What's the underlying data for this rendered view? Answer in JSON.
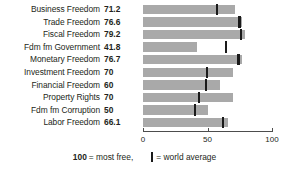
{
  "chart_data": {
    "type": "bar",
    "orientation": "horizontal",
    "title": "",
    "xlabel": "",
    "ylabel": "",
    "xlim": [
      0,
      100
    ],
    "xticks": [
      0,
      50,
      100
    ],
    "xticklabels": [
      "0",
      "50",
      "100"
    ],
    "grid": false,
    "categories": [
      "Business Freedom",
      "Trade Freedom",
      "Fiscal Freedom",
      "Fdm fm Government",
      "Monetary Freedom",
      "Investment Freedom",
      "Financial Freedom",
      "Property Rights",
      "Fdm fm Corruption",
      "Labor Freedom"
    ],
    "values": [
      71.2,
      76.6,
      79.2,
      41.8,
      76.7,
      70,
      60,
      70,
      50,
      66.1
    ],
    "value_labels": [
      "71.2",
      "76.6",
      "79.2",
      "41.8",
      "76.7",
      "70",
      "60",
      "70",
      "50",
      "66.1"
    ],
    "world_average": [
      57.5,
      74.8,
      76.0,
      64.5,
      74.0,
      49.5,
      49.0,
      43.5,
      40.5,
      62.0
    ],
    "series": [
      {
        "name": "Country score",
        "values": [
          71.2,
          76.6,
          79.2,
          41.8,
          76.7,
          70,
          60,
          70,
          50,
          66.1
        ],
        "color": "#a9a9a9"
      },
      {
        "name": "world average",
        "type": "marker",
        "values": [
          57.5,
          74.8,
          76.0,
          64.5,
          74.0,
          49.5,
          49.0,
          43.5,
          40.5,
          62.0
        ],
        "color": "#1a1a1a"
      }
    ]
  },
  "legend": {
    "most_free_value": "100",
    "most_free_text": "= most free,",
    "world_average_text": "= world average"
  },
  "colors": {
    "bar": "#a9a9a9",
    "marker": "#1a1a1a",
    "axis": "#4d4d4d",
    "text": "#231f20",
    "background": "#ffffff"
  }
}
